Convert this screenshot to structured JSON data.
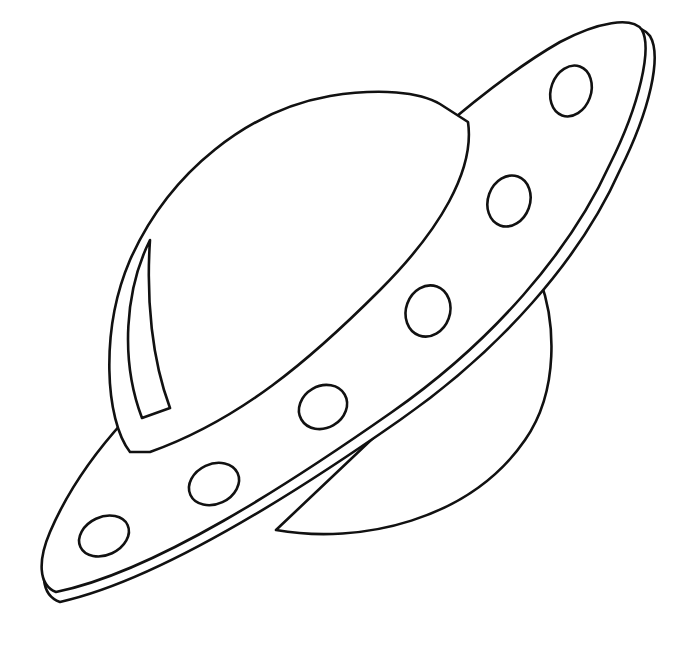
{
  "drawing": {
    "subject": "UFO flying saucer line drawing",
    "style": "black outline coloring page",
    "colors": {
      "background": "#ffffff",
      "line": "#111111"
    },
    "parts": {
      "dome": "glass dome with highlight streak",
      "disc": "saucer disc with double rim",
      "underside": "lower hull bulge",
      "portholes": 6
    }
  }
}
